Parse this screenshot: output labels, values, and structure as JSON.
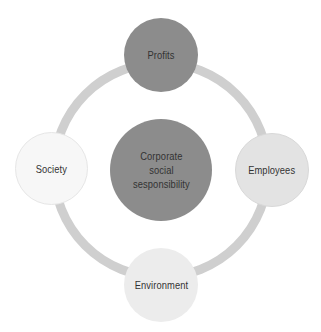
{
  "diagram": {
    "center": {
      "label": "Corporate social sesponsibility",
      "lines": [
        "Corporate",
        "social",
        "sesponsibility"
      ],
      "color": "#8c8c8c"
    },
    "nodes": [
      {
        "id": "profits",
        "label": "Profits",
        "position": "top",
        "color": "#8c8c8c"
      },
      {
        "id": "employees",
        "label": "Employees",
        "position": "right",
        "color": "#e3e3e3"
      },
      {
        "id": "environment",
        "label": "Environment",
        "position": "bottom",
        "color": "#ececec"
      },
      {
        "id": "society",
        "label": "Society",
        "position": "left",
        "color": "#f7f7f7"
      }
    ],
    "ring_color": "#cfcfcf"
  }
}
